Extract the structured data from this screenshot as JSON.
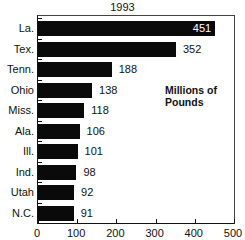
{
  "chart_data": {
    "type": "bar",
    "orientation": "horizontal",
    "title": "1993",
    "annotation": "Millions of Pounds",
    "xlabel": "",
    "ylabel": "",
    "categories": [
      "La.",
      "Tex.",
      "Tenn.",
      "Ohio",
      "Miss.",
      "Ala.",
      "Ill.",
      "Ind.",
      "Utah",
      "N.C."
    ],
    "values": [
      451,
      352,
      188,
      138,
      118,
      106,
      101,
      98,
      92,
      91
    ],
    "xlim": [
      0,
      500
    ],
    "xticks": [
      "0",
      "100",
      "200",
      "300",
      "400",
      "500"
    ],
    "grid": false,
    "legend": null,
    "bar_color": "#0a0a0a"
  }
}
